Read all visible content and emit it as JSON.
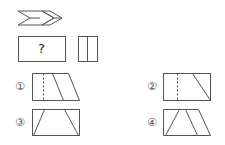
{
  "puzzle": {
    "sequence_shape": "double-chevron-arrow",
    "question_box_label": "?",
    "hint_shape": "rectangle-with-vertical-divider"
  },
  "options": [
    {
      "label": "①",
      "description": "trapezoid with dashed vertical line and one diagonal line"
    },
    {
      "label": "②",
      "description": "rectangle with dashed vertical line and one diagonal line"
    },
    {
      "label": "③",
      "description": "rectangle with two diagonal lines forming a trapezoid"
    },
    {
      "label": "④",
      "description": "trapezoid with two diagonal lines"
    }
  ],
  "colors": {
    "stroke": "#555555",
    "background": "#ffffff"
  }
}
